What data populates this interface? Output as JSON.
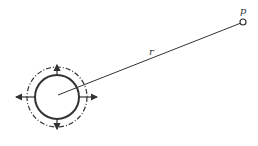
{
  "diagram": {
    "labels": {
      "point": "p",
      "distance": "r"
    },
    "colors": {
      "stroke": "#333333",
      "background": "#ffffff"
    },
    "source": {
      "center": [
        57,
        97
      ],
      "radius": 22,
      "dashed_radius": 30
    },
    "point": {
      "position": [
        243,
        22
      ]
    }
  }
}
